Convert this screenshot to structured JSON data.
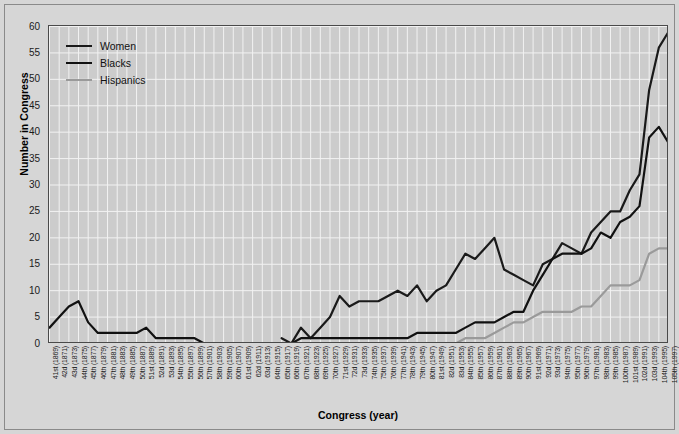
{
  "chart_data": {
    "type": "line",
    "title": "",
    "xlabel": "Congress (year)",
    "ylabel": "Number in Congress",
    "ylim": [
      0,
      60
    ],
    "ytick_step": 5,
    "yticks": [
      0,
      5,
      10,
      15,
      20,
      25,
      30,
      35,
      40,
      45,
      50,
      55,
      60
    ],
    "grid": true,
    "legend_position": "top-left",
    "background_color": "#cccccc",
    "gridline_color": "#f2f2f2",
    "axis_color": "#4a4a4a",
    "categories": [
      "41st (1869)",
      "42d (1871)",
      "43d (1873)",
      "44th (1875)",
      "45th (1877)",
      "46th (1879)",
      "47th (1881)",
      "48th (1883)",
      "49th (1885)",
      "50th (1887)",
      "51st (1889)",
      "52d (1891)",
      "53d (1893)",
      "54th (1895)",
      "55th (1897)",
      "56th (1899)",
      "57th (1901)",
      "58th (1903)",
      "59th (1905)",
      "60th (1907)",
      "61st (1909)",
      "62d (1911)",
      "63d (1913)",
      "64th (1915)",
      "65th (1917)",
      "66th (1919)",
      "67th (1921)",
      "68th (1923)",
      "69th (1925)",
      "70th (1927)",
      "71st (1929)",
      "72d (1931)",
      "73d (1933)",
      "74th (1935)",
      "75th (1937)",
      "76th (1939)",
      "77th (1941)",
      "78th (1943)",
      "79th (1945)",
      "80th (1947)",
      "81st (1949)",
      "82d (1951)",
      "83d (1953)",
      "84th (1955)",
      "85th (1957)",
      "86th (1959)",
      "87th (1961)",
      "88th (1963)",
      "89th (1965)",
      "90th (1967)",
      "91st (1969)",
      "92d (1971)",
      "93d (1973)",
      "94th (1975)",
      "95th (1977)",
      "96th (1979)",
      "97th (1981)",
      "98th (1983)",
      "99th (1985)",
      "100th (1987)",
      "101st (1989)",
      "102d (1991)",
      "103d (1993)",
      "104th (1995)",
      "105th (1997)"
    ],
    "series": [
      {
        "name": "Women",
        "color": "#1a1a1a",
        "width": 2.2,
        "values": [
          null,
          null,
          null,
          null,
          null,
          null,
          null,
          null,
          null,
          null,
          null,
          null,
          null,
          null,
          null,
          null,
          null,
          null,
          null,
          null,
          null,
          null,
          null,
          null,
          1,
          0,
          3,
          1,
          3,
          5,
          9,
          7,
          8,
          8,
          8,
          9,
          10,
          9,
          11,
          8,
          10,
          11,
          14,
          17,
          16,
          18,
          20,
          14,
          13,
          12,
          11,
          15,
          16,
          19,
          18,
          17,
          21,
          23,
          25,
          25,
          29,
          32,
          48,
          56,
          59
        ]
      },
      {
        "name": "Blacks",
        "color": "#111111",
        "width": 2.2,
        "values": [
          3,
          5,
          7,
          8,
          4,
          2,
          2,
          2,
          2,
          2,
          3,
          1,
          1,
          1,
          1,
          1,
          0,
          0,
          0,
          0,
          0,
          0,
          0,
          0,
          0,
          0,
          1,
          1,
          1,
          1,
          1,
          1,
          1,
          1,
          1,
          1,
          1,
          1,
          2,
          2,
          2,
          2,
          2,
          3,
          4,
          4,
          4,
          5,
          6,
          6,
          10,
          13,
          16,
          17,
          17,
          17,
          18,
          21,
          20,
          23,
          24,
          26,
          39,
          41,
          38
        ]
      },
      {
        "name": "Hispanics",
        "color": "#9a9a9a",
        "width": 2.2,
        "values": [
          null,
          null,
          null,
          null,
          null,
          null,
          null,
          null,
          null,
          null,
          null,
          null,
          null,
          null,
          null,
          null,
          null,
          null,
          null,
          null,
          null,
          null,
          null,
          null,
          null,
          null,
          null,
          null,
          0,
          0,
          0,
          0,
          0,
          0,
          0,
          0,
          0,
          0,
          0,
          0,
          0,
          0,
          0,
          1,
          1,
          1,
          2,
          3,
          4,
          4,
          5,
          6,
          6,
          6,
          6,
          7,
          7,
          9,
          11,
          11,
          11,
          12,
          17,
          18,
          18
        ]
      }
    ]
  },
  "legend": {
    "items": [
      {
        "label": "Women",
        "color": "#1a1a1a"
      },
      {
        "label": "Blacks",
        "color": "#111111"
      },
      {
        "label": "Hispanics",
        "color": "#9a9a9a"
      }
    ]
  },
  "axes": {
    "y_title": "Number in Congress",
    "x_title": "Congress (year)"
  }
}
